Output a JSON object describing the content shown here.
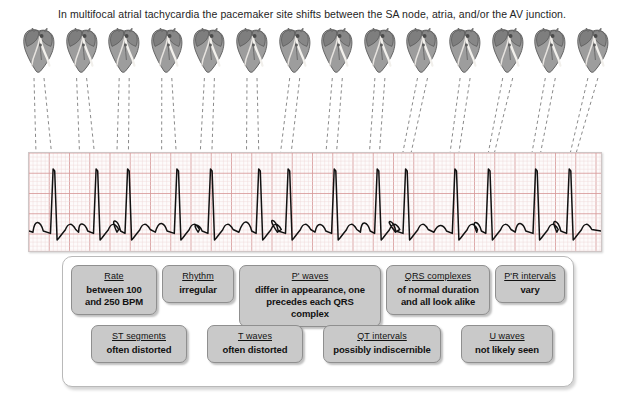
{
  "caption": "In multifocal atrial tachycardia the pacemaker site shifts between the SA node, atria, and/or the AV junction.",
  "hearts": {
    "label": "heart-conduction-diagram",
    "count": 14,
    "description": "grayscale anatomical heart illustration showing shifting pacemaker site"
  },
  "ecg": {
    "label": "ecg-rhythm-strip",
    "grid_minor_color": "#f0d6d6",
    "grid_major_color": "#d79a9a",
    "trace_color": "#111111",
    "beats": 14,
    "paper_color": "#fdfbfb"
  },
  "findings": {
    "row1": [
      {
        "title": "Rate",
        "value": "between 100\nand 250 BPM",
        "width": 86
      },
      {
        "title": "Rhythm",
        "value": "irregular",
        "width": 72
      },
      {
        "title": "P' waves",
        "value": "differ in appearance, one\nprecedes each QRS complex",
        "width": 142
      },
      {
        "title": "QRS complexes",
        "value": "of normal duration\nand all look alike",
        "width": 104
      },
      {
        "title": "P'R intervals",
        "value": "vary",
        "width": 70
      }
    ],
    "row2": [
      {
        "title": "ST segments",
        "value": "often distorted",
        "width": 96
      },
      {
        "title": "T waves",
        "value": "often distorted",
        "width": 96
      },
      {
        "title": "QT intervals",
        "value": "possibly indiscernible",
        "width": 118
      },
      {
        "title": "U waves",
        "value": "not likely seen",
        "width": 92
      }
    ]
  },
  "colors": {
    "box_fill": "#c9c9c9",
    "box_border": "#8f8f8f",
    "panel_border": "#b9b9b9",
    "text": "#111111",
    "leader_line": "#8a8a8a"
  }
}
